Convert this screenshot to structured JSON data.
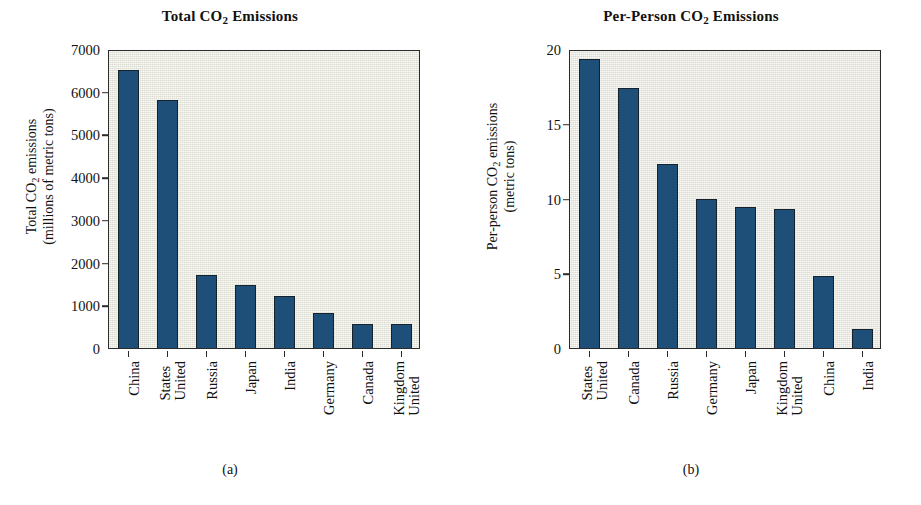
{
  "figure": {
    "panels": [
      {
        "id": "a",
        "caption": "(a)",
        "title_prefix": "Total CO",
        "title_sub": "2",
        "title_suffix": " Emissions",
        "ylabel_line1_prefix": "Total CO",
        "ylabel_line1_sub": "2",
        "ylabel_line1_suffix": " emissions",
        "ylabel_line2": "(millions of metric tons)"
      },
      {
        "id": "b",
        "caption": "(b)",
        "title_prefix": "Per-Person CO",
        "title_sub": "2",
        "title_suffix": " Emissions",
        "ylabel_line1_prefix": "Per-person CO",
        "ylabel_line1_sub": "2",
        "ylabel_line1_suffix": " emissions",
        "ylabel_line2": "(metric tons)"
      }
    ]
  },
  "chart_data": [
    {
      "type": "bar",
      "id": "a",
      "title": "Total CO2 Emissions",
      "caption": "(a)",
      "xlabel": "",
      "ylabel": "Total CO2 emissions (millions of metric tons)",
      "ylim": [
        0,
        7000
      ],
      "yticks": [
        0,
        1000,
        2000,
        3000,
        4000,
        5000,
        6000,
        7000
      ],
      "ytick_labels": [
        "0",
        "1000",
        "2000",
        "3000",
        "4000",
        "5000",
        "6000",
        "7000"
      ],
      "grid": false,
      "legend": "none",
      "bar_color": "#1d4f78",
      "plot_background": "#e9e8de",
      "categories": [
        "China",
        "United States",
        "Russia",
        "Japan",
        "India",
        "Germany",
        "Canada",
        "United Kingdom"
      ],
      "category_lines": [
        [
          "China"
        ],
        [
          "United",
          "States"
        ],
        [
          "Russia"
        ],
        [
          "Japan"
        ],
        [
          "India"
        ],
        [
          "Germany"
        ],
        [
          "Canada"
        ],
        [
          "United",
          "Kingdom"
        ]
      ],
      "values": [
        6500,
        5800,
        1720,
        1470,
        1210,
        820,
        570,
        560
      ]
    },
    {
      "type": "bar",
      "id": "b",
      "title": "Per-Person CO2 Emissions",
      "caption": "(b)",
      "xlabel": "",
      "ylabel": "Per-person CO2 emissions (metric tons)",
      "ylim": [
        0,
        20
      ],
      "yticks": [
        0,
        5,
        10,
        15,
        20
      ],
      "ytick_labels": [
        "0",
        "5",
        "10",
        "15",
        "20"
      ],
      "grid": false,
      "legend": "none",
      "bar_color": "#1d4f78",
      "plot_background": "#e9e8de",
      "categories": [
        "United States",
        "Canada",
        "Russia",
        "Germany",
        "Japan",
        "United Kingdom",
        "China",
        "India"
      ],
      "category_lines": [
        [
          "United",
          "States"
        ],
        [
          "Canada"
        ],
        [
          "Russia"
        ],
        [
          "Germany"
        ],
        [
          "Japan"
        ],
        [
          "United",
          "Kingdom"
        ],
        [
          "China"
        ],
        [
          "India"
        ]
      ],
      "values": [
        19.3,
        17.4,
        12.3,
        10.0,
        9.4,
        9.3,
        4.8,
        1.3
      ]
    }
  ]
}
